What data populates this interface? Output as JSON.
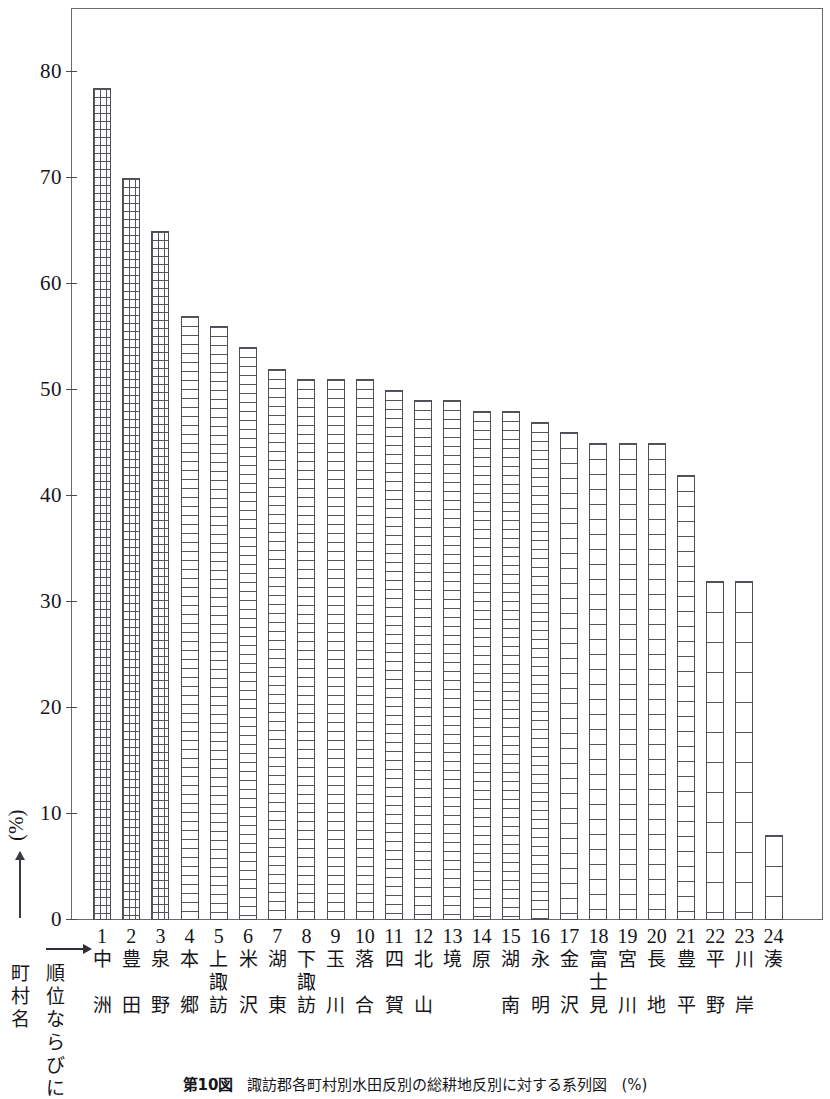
{
  "chart_data": {
    "type": "bar",
    "title": "諏訪郡各町村別水田反別の総耕地反別に対する系列図",
    "figure_number": "第10図",
    "title_unit": "(%)",
    "xlabel": "順位ならびに町村名",
    "ylabel": "(%)",
    "ylim": [
      0,
      86
    ],
    "yticks": [
      0,
      10,
      20,
      30,
      40,
      50,
      60,
      70,
      80
    ],
    "ytick_labels": [
      "0",
      "10",
      "20",
      "30",
      "40",
      "50",
      "60",
      "70",
      "80"
    ],
    "grid": false,
    "legend": null,
    "ranks": [
      "1",
      "2",
      "3",
      "4",
      "5",
      "6",
      "7",
      "8",
      "9",
      "10",
      "11",
      "12",
      "13",
      "14",
      "15",
      "16",
      "17",
      "18",
      "19",
      "20",
      "21",
      "22",
      "23",
      "24"
    ],
    "categories": [
      "中洲",
      "豊田",
      "泉野",
      "本郷",
      "上諏訪",
      "米沢",
      "湖東",
      "下諏訪",
      "玉川",
      "落合",
      "四賀",
      "北山",
      "境",
      "原",
      "湖南",
      "永明",
      "金沢",
      "富士見",
      "宮川",
      "長地",
      "豊平",
      "平野",
      "川岸",
      "湊"
    ],
    "category_lines": [
      [
        "中",
        "",
        "洲"
      ],
      [
        "豊",
        "",
        "田"
      ],
      [
        "泉",
        "",
        "野"
      ],
      [
        "本",
        "",
        "郷"
      ],
      [
        "上",
        "諏",
        "訪"
      ],
      [
        "米",
        "",
        "沢"
      ],
      [
        "湖",
        "",
        "東"
      ],
      [
        "下",
        "諏",
        "訪"
      ],
      [
        "玉",
        "",
        "川"
      ],
      [
        "落",
        "",
        "合"
      ],
      [
        "四",
        "",
        "賀"
      ],
      [
        "北",
        "",
        "山"
      ],
      [
        "境",
        "",
        ""
      ],
      [
        "原",
        "",
        ""
      ],
      [
        "湖",
        "",
        "南"
      ],
      [
        "永",
        "",
        "明"
      ],
      [
        "金",
        "",
        "沢"
      ],
      [
        "富",
        "士",
        "見"
      ],
      [
        "宮",
        "",
        "川"
      ],
      [
        "長",
        "",
        "地"
      ],
      [
        "豊",
        "",
        "平"
      ],
      [
        "平",
        "",
        "野"
      ],
      [
        "川",
        "",
        "岸"
      ],
      [
        "湊",
        "",
        ""
      ]
    ],
    "values": [
      78.5,
      70,
      65,
      57,
      56,
      54,
      52,
      51,
      51,
      51,
      50,
      49,
      49,
      48,
      48,
      47,
      46,
      45,
      45,
      45,
      42,
      32,
      32,
      8
    ],
    "bar_fill_patterns": [
      "cross",
      "cross",
      "cross",
      "dense",
      "dense",
      "dense",
      "dense",
      "dense",
      "dense",
      "dense",
      "dense",
      "dense",
      "dense",
      "dense",
      "dense",
      "dense",
      "med",
      "med",
      "med",
      "med",
      "med",
      "wide",
      "wide",
      "wide"
    ]
  },
  "axis": {
    "row_header_rank": [
      "順",
      "位",
      "な",
      "ら",
      "び",
      "に"
    ],
    "row_header_name": [
      "町",
      "村",
      "名"
    ],
    "arrow_icon": "right-arrow-icon",
    "y_arrow_icon": "up-arrow-icon"
  },
  "caption": {
    "figure_number": "第10図",
    "text": "諏訪郡各町村別水田反別の総耕地反別に対する系列図",
    "unit": "(%)"
  }
}
